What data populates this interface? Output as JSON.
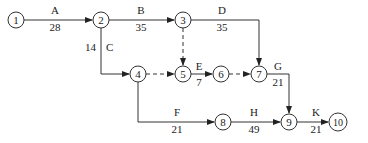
{
  "diagram": {
    "type": "activity-on-arrow network",
    "nodes": [
      {
        "id": "1",
        "label": "1"
      },
      {
        "id": "2",
        "label": "2"
      },
      {
        "id": "3",
        "label": "3"
      },
      {
        "id": "4",
        "label": "4"
      },
      {
        "id": "5",
        "label": "5"
      },
      {
        "id": "6",
        "label": "6"
      },
      {
        "id": "7",
        "label": "7"
      },
      {
        "id": "8",
        "label": "8"
      },
      {
        "id": "9",
        "label": "9"
      },
      {
        "id": "10",
        "label": "10"
      }
    ],
    "activities": [
      {
        "name": "A",
        "from": "1",
        "to": "2",
        "duration": "28"
      },
      {
        "name": "B",
        "from": "2",
        "to": "3",
        "duration": "35"
      },
      {
        "name": "C",
        "from": "2",
        "to": "4",
        "duration": "14"
      },
      {
        "name": "D",
        "from": "3",
        "to": "7",
        "duration": "35"
      },
      {
        "name": "E",
        "from": "5",
        "to": "6",
        "duration": "7"
      },
      {
        "name": "G",
        "from": "7",
        "to": "9",
        "duration": "21"
      },
      {
        "name": "F",
        "from": "4",
        "to": "8",
        "duration": "21"
      },
      {
        "name": "H",
        "from": "8",
        "to": "9",
        "duration": "49"
      },
      {
        "name": "K",
        "from": "9",
        "to": "10",
        "duration": "21"
      }
    ],
    "dummies": [
      {
        "from": "3",
        "to": "5"
      },
      {
        "from": "4",
        "to": "5"
      },
      {
        "from": "6",
        "to": "7"
      }
    ]
  }
}
